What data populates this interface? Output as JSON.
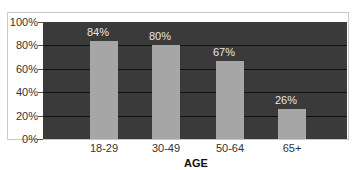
{
  "chart_data": {
    "type": "bar",
    "title": "",
    "xlabel": "AGE",
    "ylabel": "",
    "categories": [
      "18-29",
      "30-49",
      "50-64",
      "65+"
    ],
    "values": [
      84,
      80,
      67,
      26
    ],
    "value_labels": [
      "84%",
      "80%",
      "67%",
      "26%"
    ],
    "ylim": [
      0,
      100
    ],
    "yticks": [
      "0%",
      "20%",
      "40%",
      "60%",
      "80%",
      "100%"
    ],
    "grid": true,
    "legend": null,
    "colors": {
      "plot_background": "#3a3a3a",
      "bar": "#a6a6a6",
      "gridline": "#111111",
      "value_label": "#e6e6e6"
    }
  }
}
